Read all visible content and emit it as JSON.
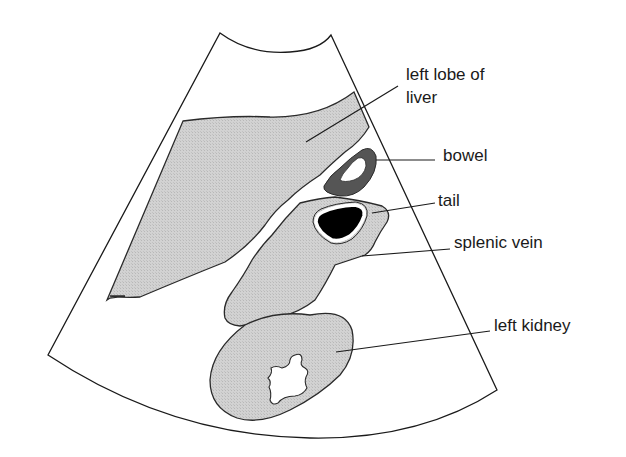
{
  "diagram": {
    "type": "ultrasound-schematic",
    "colors": {
      "tissue_fill": "#cfcfcf",
      "outline": "#2a2a2a",
      "bowel_wall": "#555555",
      "vessel_lumen": "#000000",
      "background": "#ffffff"
    },
    "labels": {
      "liver_line1": "left lobe of",
      "liver_line2": "liver",
      "bowel": "bowel",
      "tail": "tail",
      "splenic_vein": "splenic vein",
      "left_kidney": "left kidney"
    },
    "structures": [
      {
        "id": "liver",
        "name": "left lobe of liver",
        "fill": "gray"
      },
      {
        "id": "bowel",
        "name": "bowel",
        "fill": "dark gray ring"
      },
      {
        "id": "tail",
        "name": "tail (of pancreas)",
        "fill": "gray"
      },
      {
        "id": "splenic-vein",
        "name": "splenic vein",
        "fill": "black"
      },
      {
        "id": "left-kidney",
        "name": "left kidney",
        "fill": "gray with white sinus"
      }
    ]
  }
}
